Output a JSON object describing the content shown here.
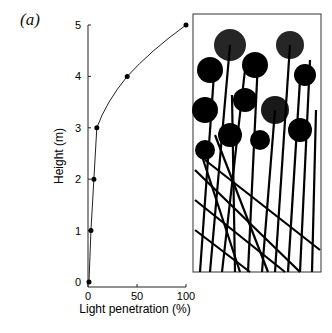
{
  "panel_label": "(a)",
  "chart_data": {
    "type": "line",
    "title": "",
    "xlabel": "Light penetration (%)",
    "ylabel": "Height (m)",
    "xlim": [
      0,
      100
    ],
    "ylim": [
      0,
      5
    ],
    "x_ticks": [
      "0",
      "50",
      "100"
    ],
    "y_ticks": [
      "0",
      "1",
      "2",
      "3",
      "4",
      "5"
    ],
    "grid": false,
    "legend": null,
    "series": [
      {
        "name": "Light penetration",
        "x": [
          1,
          3,
          6,
          9,
          40,
          100
        ],
        "y": [
          0,
          1,
          2,
          3,
          4,
          5
        ]
      }
    ]
  },
  "illustration": {
    "description": "Black-and-white drawing of tall papyrus-like plants with umbel heads"
  }
}
